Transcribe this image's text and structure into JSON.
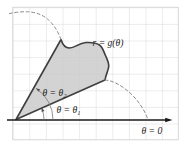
{
  "figure": {
    "curve_label": "r = g(θ)",
    "upper_ray_label": {
      "main": "θ = θ",
      "sub": "2"
    },
    "lower_ray_label": {
      "main": "θ = θ",
      "sub": "1"
    },
    "axis_label": "θ = 0"
  },
  "colors": {
    "grid": "#d9d9d9",
    "region_fill": "#c9c9c9",
    "boundary": "#3f3f3f",
    "dashed_curve": "#8a8a8a",
    "angle_arc": "#777777",
    "axis": "#1a1a1a",
    "label_text": "#222222"
  }
}
